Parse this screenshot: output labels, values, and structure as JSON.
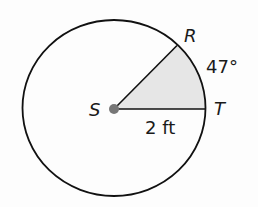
{
  "diagram": {
    "type": "circle-sector",
    "center": {
      "label": "S"
    },
    "points": [
      {
        "label": "R"
      },
      {
        "label": "T"
      }
    ],
    "angle_label": "47°",
    "radius_label": "2 ft",
    "colors": {
      "stroke": "#111111",
      "sector_fill": "#e6e6e6",
      "center_dot": "#777777"
    }
  }
}
